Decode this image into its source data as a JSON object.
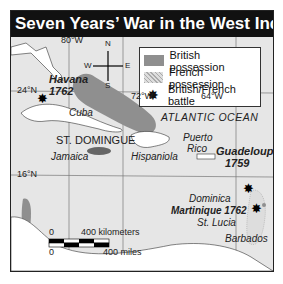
{
  "title": "Seven Years’ War in the West Indies",
  "legend": {
    "items": [
      {
        "symbol": "gray-fill",
        "label": "British possession"
      },
      {
        "symbol": "dotted-fill",
        "label": "French possession"
      },
      {
        "symbol": "star-burst",
        "label": "British/French battle"
      }
    ]
  },
  "compass": {
    "n": "N",
    "s": "S",
    "e": "E",
    "w": "W"
  },
  "gridlines": {
    "lon": [
      "80°W",
      "72°W",
      "64°W"
    ],
    "lat": [
      "24°N",
      "16°N"
    ]
  },
  "places": {
    "havana": "Havana",
    "havana_year": "1762",
    "cuba": "Cuba",
    "st_domingue": "ST. DOMINGUE",
    "jamaica": "Jamaica",
    "hispaniola": "Hispaniola",
    "atlantic": "ATLANTIC OCEAN",
    "puerto_rico_1": "Puerto",
    "puerto_rico_2": "Rico",
    "guadeloupe": "Guadeloupe",
    "guadeloupe_year": "1759",
    "dominica": "Dominica",
    "martinique": "Martinique 1762",
    "st_lucia": "St. Lucia",
    "barbados": "Barbados"
  },
  "scale": {
    "km_zero": "0",
    "km_label": "400 kilometers",
    "mi_zero": "0",
    "mi_label": "400 miles"
  },
  "colors": {
    "british": "#8f8f8f",
    "french_dots": "#aaaaaa",
    "land": "#ffffff",
    "sea": "#e6e6e6",
    "title_bg": "#111111"
  }
}
